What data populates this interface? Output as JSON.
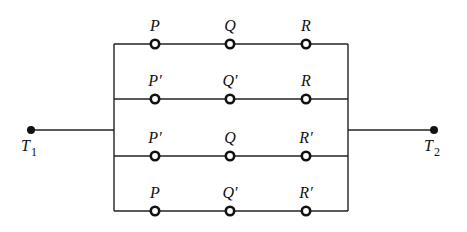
{
  "diagram": {
    "type": "switching-circuit",
    "terminals": [
      {
        "id": "T1",
        "label": "T",
        "subscript": "1",
        "x": 31,
        "y": 130
      },
      {
        "id": "T2",
        "label": "T",
        "subscript": "2",
        "x": 434,
        "y": 130
      }
    ],
    "bus": {
      "left_x": 114,
      "right_x": 348,
      "top_y": 44,
      "bottom_y": 211
    },
    "columns_x": [
      155,
      230,
      306
    ],
    "branches": [
      {
        "y": 44,
        "switches": [
          "P",
          "Q",
          "R"
        ]
      },
      {
        "y": 99,
        "switches": [
          "P′",
          "Q′",
          "R"
        ]
      },
      {
        "y": 156,
        "switches": [
          "P′",
          "Q",
          "R′"
        ]
      },
      {
        "y": 211,
        "switches": [
          "P",
          "Q′",
          "R′"
        ]
      }
    ]
  }
}
